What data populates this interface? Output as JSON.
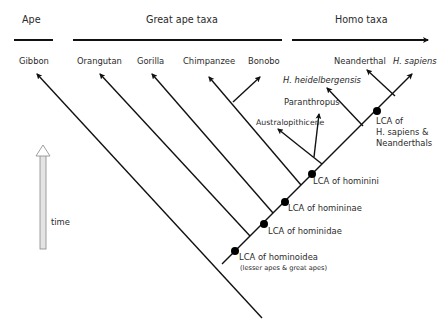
{
  "headers": {
    "ape": "Ape",
    "great_ape": "Great ape taxa",
    "homo": "Homo taxa"
  },
  "taxa": {
    "gibbon": "Gibbon",
    "orangutan": "Orangutan",
    "gorilla": "Gorilla",
    "chimpanzee": "Chimpanzee",
    "bonobo": "Bonobo",
    "neanderthal": "Neanderthal",
    "h_sapiens": "H. sapiens",
    "h_heidelbergensis": "H. heidelbergensis",
    "paranthropus": "Paranthropus",
    "australopithicene": "Australopithicene"
  },
  "nodes": {
    "hominoidea": "LCA of hominoidea",
    "hominoidea_note": "(lesser apes & great apes)",
    "hominidae": "LCA of hominidae",
    "homininae": "LCA of homininae",
    "hominini": "LCA of hominini",
    "sapiens_neanderthal_1": "LCA of",
    "sapiens_neanderthal_2": "H. sapiens &",
    "sapiens_neanderthal_3": "Neanderthals"
  },
  "time_axis": {
    "label": "time"
  }
}
